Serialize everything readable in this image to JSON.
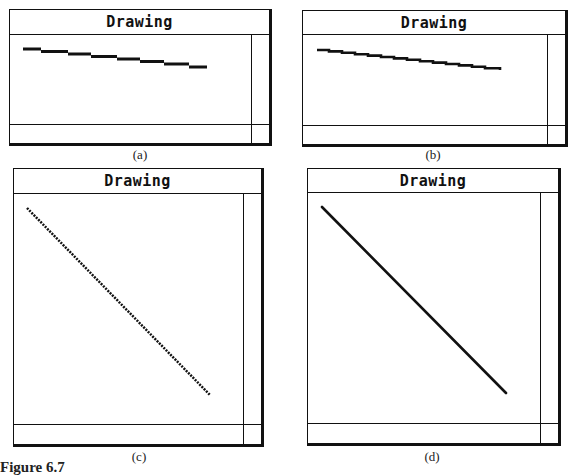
{
  "figure": {
    "label": "Figure 6.7",
    "panels": [
      {
        "id": "a",
        "window_title": "Drawing",
        "caption": "(a)",
        "line_style": "coarse staircase (8 horizontal steps)",
        "line": {
          "x1": 23,
          "y1": 49,
          "x2": 207,
          "y2": 68
        }
      },
      {
        "id": "b",
        "window_title": "Drawing",
        "caption": "(b)",
        "line_style": "fine staircase",
        "line": {
          "x1": 317,
          "y1": 50,
          "x2": 500,
          "y2": 70
        }
      },
      {
        "id": "c",
        "window_title": "Drawing",
        "caption": "(c)",
        "line_style": "dotted jagged diagonal",
        "line": {
          "x1": 27,
          "y1": 208,
          "x2": 210,
          "y2": 395
        }
      },
      {
        "id": "d",
        "window_title": "Drawing",
        "caption": "(d)",
        "line_style": "smooth diagonal",
        "line": {
          "x1": 322,
          "y1": 207,
          "x2": 506,
          "y2": 393
        }
      }
    ]
  },
  "colors": {
    "ink": "#111111",
    "background": "#ffffff"
  }
}
